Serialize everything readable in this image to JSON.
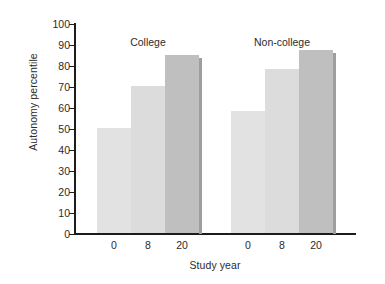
{
  "chart_data": {
    "type": "bar",
    "title": "",
    "xlabel": "Study year",
    "ylabel": "Autonomy percentile",
    "ylim": [
      0,
      100
    ],
    "ytick_step": 10,
    "yticks": [
      "100",
      "90",
      "80",
      "70",
      "60",
      "50",
      "40",
      "30",
      "20",
      "10",
      "0"
    ],
    "grid": false,
    "legend": "none",
    "group_labels": [
      "College",
      "Non-college"
    ],
    "categories": [
      "0",
      "8",
      "20"
    ],
    "series": [
      {
        "name": "College",
        "values": [
          50,
          70,
          85
        ]
      },
      {
        "name": "Non-college",
        "values": [
          58,
          78,
          87
        ]
      }
    ],
    "bars": [
      {
        "group": "College",
        "category": "0",
        "value": 50,
        "color": "#e2e2e2"
      },
      {
        "group": "College",
        "category": "8",
        "value": 70,
        "color": "#dcdcdc"
      },
      {
        "group": "College",
        "category": "20",
        "value": 85,
        "color": "#bfbfbf"
      },
      {
        "group": "Non-college",
        "category": "0",
        "value": 58,
        "color": "#e2e2e2"
      },
      {
        "group": "Non-college",
        "category": "8",
        "value": 78,
        "color": "#dcdcdc"
      },
      {
        "group": "Non-college",
        "category": "20",
        "value": 87,
        "color": "#bfbfbf"
      }
    ],
    "colors": {
      "light_bar": "#e2e2e2",
      "mid_bar": "#dcdcdc",
      "dark_bar": "#bfbfbf",
      "shadow": "#9e9e9e",
      "axis": "#1c1c1c",
      "text": "#2b2b2b",
      "background": "#ffffff"
    }
  }
}
